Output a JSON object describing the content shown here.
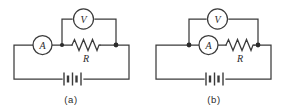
{
  "figure": {
    "background_color": "#ffffff",
    "stroke_color": "#3b3b3b",
    "node_color": "#2b2b2b",
    "width": 287,
    "height": 110
  },
  "panels": [
    {
      "id": "a",
      "caption": "(a)",
      "components": {
        "ammeter": {
          "label": "A",
          "name": "ammeter",
          "position": "left-branch"
        },
        "voltmeter": {
          "label": "V",
          "name": "voltmeter",
          "position": "top-branch"
        },
        "resistor": {
          "label": "R",
          "name": "resistor",
          "position": "middle-branch"
        },
        "battery": {
          "label": "",
          "name": "battery",
          "position": "bottom-branch",
          "cells": 2
        }
      },
      "description": "Voltmeter connected across the resistor only; ammeter in series outside the voltmeter branch"
    },
    {
      "id": "b",
      "caption": "(b)",
      "components": {
        "ammeter": {
          "label": "A",
          "name": "ammeter",
          "position": "middle-branch-left"
        },
        "voltmeter": {
          "label": "V",
          "name": "voltmeter",
          "position": "top-branch"
        },
        "resistor": {
          "label": "R",
          "name": "resistor",
          "position": "middle-branch-right"
        },
        "battery": {
          "label": "",
          "name": "battery",
          "position": "bottom-branch",
          "cells": 2
        }
      },
      "description": "Voltmeter connected across the series combination of ammeter and resistor"
    }
  ]
}
